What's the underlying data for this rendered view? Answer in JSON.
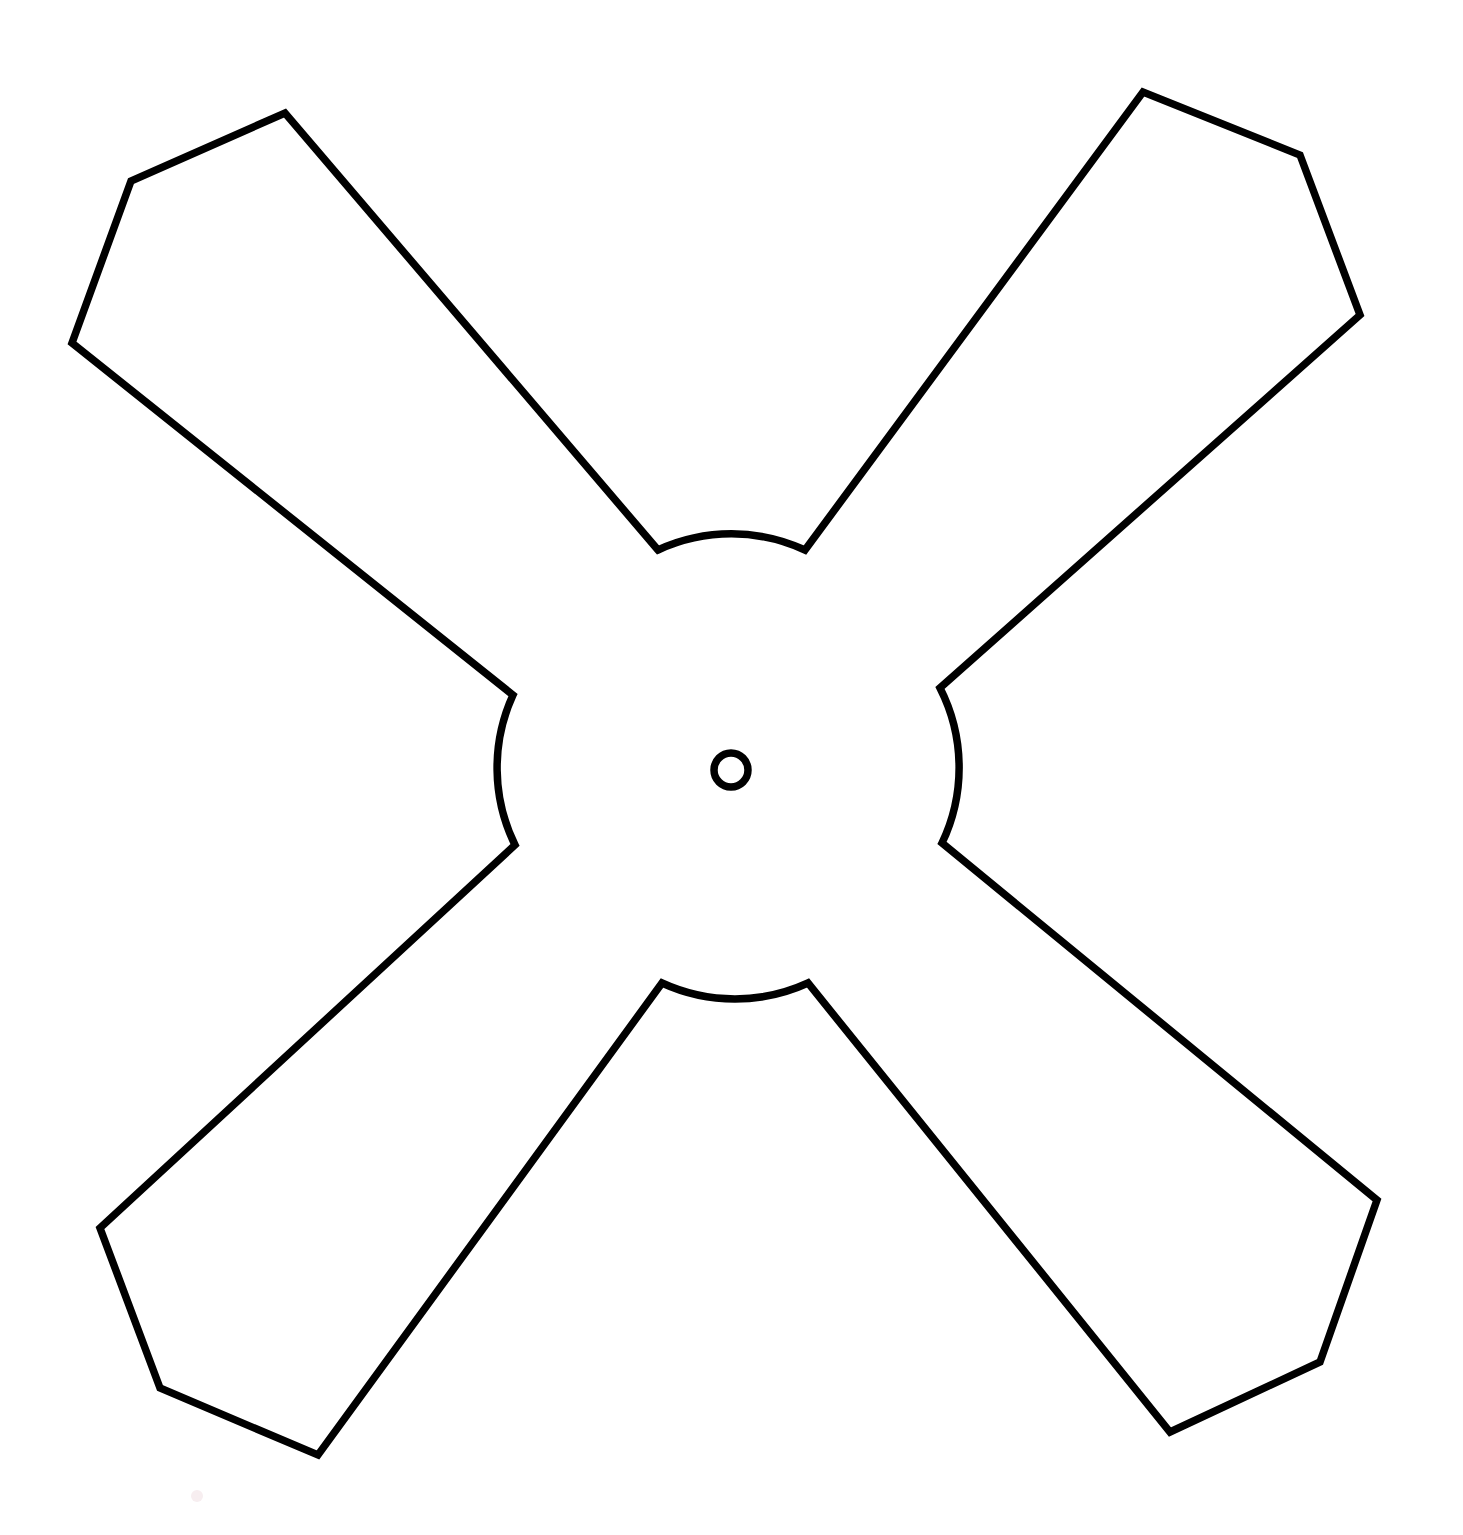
{
  "figure": {
    "canvas": {
      "width": 1463,
      "height": 1535,
      "background": "#ffffff"
    },
    "stroke_color": "#000000",
    "stroke_width": 7.5,
    "fill_color": "#ffffff"
  },
  "geometry": {
    "center": {
      "x": 731,
      "y": 772
    },
    "hub_hole": {
      "cx": 731,
      "cy": 770,
      "outer_r": 21,
      "inner_r": 13
    },
    "outline_d": "M 658 550 L 285 113 L 131 181 L 72 343 L 513 695 A 175 175 0 0 0 515 845 L 100 1228 L 160 1388 L 318 1455 L 662 983 A 175 175 0 0 0 808 983 L 1170 1432 L 1320 1362 L 1377 1200 L 942 843 A 175 175 0 0 0 940 688 L 1360 315 L 1300 155 L 1143 92 L 805 550 A 175 175 0 0 0 658 550 Z",
    "blade_tips": [
      {
        "name": "top-left",
        "vertices": [
          [
            285,
            113
          ],
          [
            131,
            181
          ],
          [
            72,
            343
          ]
        ]
      },
      {
        "name": "top-right",
        "vertices": [
          [
            1143,
            92
          ],
          [
            1300,
            155
          ],
          [
            1360,
            315
          ]
        ]
      },
      {
        "name": "bottom-right",
        "vertices": [
          [
            1377,
            1200
          ],
          [
            1320,
            1362
          ],
          [
            1170,
            1432
          ]
        ]
      },
      {
        "name": "bottom-left",
        "vertices": [
          [
            100,
            1228
          ],
          [
            160,
            1388
          ],
          [
            318,
            1455
          ]
        ]
      }
    ],
    "fillet_arcs": [
      {
        "name": "top-arc",
        "from": [
          658,
          550
        ],
        "to": [
          805,
          550
        ],
        "radius": 175,
        "bulge": "up"
      },
      {
        "name": "left-arc",
        "from": [
          513,
          695
        ],
        "to": [
          515,
          845
        ],
        "radius": 175,
        "bulge": "left"
      },
      {
        "name": "bottom-arc",
        "from": [
          662,
          983
        ],
        "to": [
          808,
          983
        ],
        "radius": 175,
        "bulge": "down"
      },
      {
        "name": "right-arc",
        "from": [
          940,
          688
        ],
        "to": [
          942,
          843
        ],
        "radius": 175,
        "bulge": "right"
      }
    ],
    "speck": {
      "cx": 197,
      "cy": 1496,
      "r": 6,
      "color": "#f7eef0"
    }
  }
}
